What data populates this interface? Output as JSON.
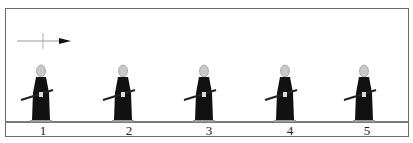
{
  "diagram": {
    "direction_indicator": "arrow-right",
    "figures": [
      {
        "label": "1",
        "sword_angle": "low"
      },
      {
        "label": "2",
        "sword_angle": "low"
      },
      {
        "label": "3",
        "sword_angle": "low"
      },
      {
        "label": "4",
        "sword_angle": "low"
      },
      {
        "label": "5",
        "sword_angle": "low"
      }
    ],
    "colors": {
      "figure": "#111111",
      "head": "#c8c8c8",
      "frame": "#6a6a6a"
    }
  }
}
